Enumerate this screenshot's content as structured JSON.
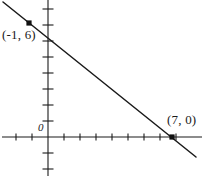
{
  "figure": {
    "kind": "coordinate-plane-line-graph",
    "background_color": "#ffffff",
    "ink_color": "#1a1a1a",
    "width": 202,
    "height": 176
  },
  "labels": {
    "point_a": "(-1, 6)",
    "point_b": "(7, 0)",
    "origin": "0"
  },
  "chart_data": {
    "type": "line",
    "title": "",
    "xlabel": "",
    "ylabel": "",
    "grid": false,
    "legend": null,
    "axes": {
      "x_axis": {
        "pixel_y": 137,
        "pixel_x_start": 2,
        "pixel_x_end": 202,
        "tick_spacing_px": 16,
        "tick_pixels_x": [
          16,
          32,
          64,
          80,
          96,
          112,
          128,
          144,
          160,
          176
        ],
        "labeled_ticks": []
      },
      "y_axis": {
        "pixel_x": 48,
        "pixel_y_start": 0,
        "pixel_y_end": 176,
        "tick_spacing_px": 16,
        "tick_pixels_y": [
          9,
          25,
          41,
          57,
          73,
          89,
          105,
          121,
          153,
          169
        ],
        "labeled_ticks": []
      },
      "origin_pixel": [
        48,
        137
      ],
      "units_per_tick": 1,
      "xlim": [
        -3,
        10
      ],
      "ylim": [
        -3,
        9
      ]
    },
    "series": [
      {
        "name": "line",
        "equation": "y = -0.75x + 5.25",
        "slope": -0.75,
        "y_intercept": 5.25,
        "x_intercept": 7,
        "pixel_start": [
          3,
          2
        ],
        "pixel_end": [
          196,
          157
        ],
        "x": [
          -1,
          7
        ],
        "y": [
          6,
          0
        ]
      }
    ],
    "points": [
      {
        "label": "(-1, 6)",
        "x": -1,
        "y": 6,
        "pixel": [
          29,
          23
        ],
        "label_pixel": [
          2,
          28
        ],
        "marker": "square"
      },
      {
        "label": "(7, 0)",
        "x": 7,
        "y": 0,
        "pixel": [
          172,
          137
        ],
        "label_pixel": [
          167,
          113
        ],
        "marker": "square"
      }
    ],
    "annotations": [
      {
        "text": "0",
        "role": "origin-label",
        "pixel": [
          38,
          122
        ]
      }
    ]
  }
}
